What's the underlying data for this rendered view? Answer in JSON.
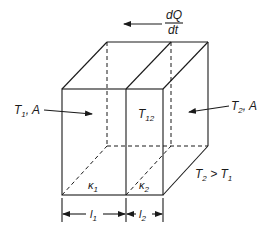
{
  "figure": {
    "heat_flow": {
      "label_numerator": "dQ",
      "label_denominator": "dt",
      "direction": "left"
    },
    "left_face": {
      "label_main": "T",
      "label_sub": "1",
      "label_suffix": ", A"
    },
    "right_face": {
      "label_main": "T",
      "label_sub": "2",
      "label_suffix": ", A"
    },
    "interface": {
      "label_main": "T",
      "label_sub": "12"
    },
    "layers": [
      {
        "conductivity_main": "κ",
        "conductivity_sub": "1",
        "thickness_main": "l",
        "thickness_sub": "1"
      },
      {
        "conductivity_main": "κ",
        "conductivity_sub": "2",
        "thickness_main": "l",
        "thickness_sub": "2"
      }
    ],
    "condition": {
      "a_main": "T",
      "a_sub": "2",
      "op": " > ",
      "b_main": "T",
      "b_sub": "1"
    }
  }
}
